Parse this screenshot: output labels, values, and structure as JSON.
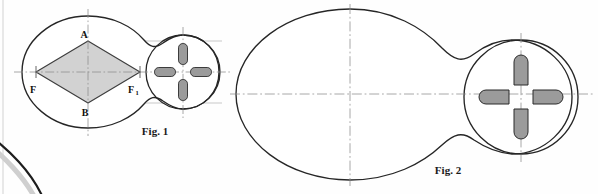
{
  "page": {
    "background_color": "#fefefe",
    "width": 598,
    "height": 194,
    "scan_artifacts": {
      "left_margin_line_color": "#d8d8d8",
      "bottom_left_page_edge_color": "#1d1d1d"
    }
  },
  "style": {
    "outline_color": "#262626",
    "outline_width": 1.3,
    "thin_line_color": "#9a9a9a",
    "thin_line_width": 0.6,
    "centerline_color": "#8c8c8c",
    "centerline_width": 0.7,
    "centerline_dash": "8,2.5,1.5,2.5",
    "diamond_fill": "#d2d2d2",
    "diamond_stroke": "#3a3a3a",
    "slot_fill": "#9b9b9b",
    "slot_stroke": "#2b2b2b",
    "slot_highlight": "#c4c4c4"
  },
  "figures": [
    {
      "id": "fig1",
      "caption": "Fig. 1",
      "caption_x": 155,
      "caption_y": 133,
      "description": "Two-lobe cam profile with inscribed shaded rhombus and small circular boss containing four radial slots",
      "big_lobe": {
        "cx": 88,
        "cy": 72,
        "rx": 66,
        "ry": 56
      },
      "small_lobe": {
        "cx": 183,
        "cy": 72,
        "r": 39
      },
      "centerlines": {
        "horizontal": {
          "x1": 14,
          "y1": 72,
          "x2": 232,
          "y2": 72
        },
        "vertical_big": {
          "x": 88,
          "y1": 10,
          "y2": 136
        },
        "vertical_small": {
          "x": 183,
          "y1": 28,
          "y2": 117
        }
      },
      "rhombus": {
        "top": {
          "label": "A",
          "x": 88,
          "y": 41
        },
        "bottom": {
          "label": "B",
          "x": 88,
          "y": 103
        },
        "left": {
          "label": "F",
          "x": 36,
          "y": 72
        },
        "right": {
          "label": "F1",
          "x": 140,
          "y": 72
        }
      },
      "point_labels": [
        {
          "text": "A",
          "sub": "",
          "x": 85,
          "y": 37
        },
        {
          "text": "B",
          "sub": "",
          "x": 85,
          "y": 114
        },
        {
          "text": "F",
          "sub": "",
          "x": 31,
          "y": 91
        },
        {
          "text": "F",
          "sub": "1",
          "x": 131,
          "y": 91
        }
      ],
      "projection_lines": [
        {
          "x1": 88,
          "y1": 41,
          "x2": 222,
          "y2": 41
        },
        {
          "x1": 88,
          "y1": 103,
          "x2": 222,
          "y2": 103
        }
      ],
      "slots": [
        {
          "position": "top",
          "cx": 183,
          "cy": 54,
          "w": 9,
          "h": 21
        },
        {
          "position": "bottom",
          "cx": 183,
          "cy": 90,
          "w": 9,
          "h": 21
        },
        {
          "position": "left",
          "cx": 165,
          "cy": 72,
          "w": 21,
          "h": 9
        },
        {
          "position": "right",
          "cx": 201,
          "cy": 72,
          "w": 21,
          "h": 9
        }
      ]
    },
    {
      "id": "fig2",
      "caption": "Fig. 2",
      "caption_x": 448,
      "caption_y": 172,
      "description": "Same two-lobe cam profile drawn larger without the inscribed rhombus",
      "big_lobe": {
        "cx": 350,
        "cy": 94,
        "rx": 115,
        "ry": 86
      },
      "small_lobe": {
        "cx": 522,
        "cy": 97,
        "r": 62
      },
      "centerlines": {
        "horizontal": {
          "x1": 232,
          "y1": 94,
          "x2": 592,
          "y2": 94
        },
        "vertical_big": {
          "x": 350,
          "y1": 6,
          "y2": 184
        },
        "vertical_small": {
          "x": 522,
          "y1": 34,
          "y2": 160
        }
      },
      "slots": [
        {
          "position": "top",
          "cx": 522,
          "cy": 68,
          "w": 14,
          "h": 33
        },
        {
          "position": "bottom",
          "cx": 522,
          "cy": 126,
          "w": 14,
          "h": 33
        },
        {
          "position": "left",
          "cx": 493,
          "cy": 97,
          "w": 33,
          "h": 14
        },
        {
          "position": "right",
          "cx": 551,
          "cy": 97,
          "w": 33,
          "h": 14
        }
      ]
    }
  ]
}
